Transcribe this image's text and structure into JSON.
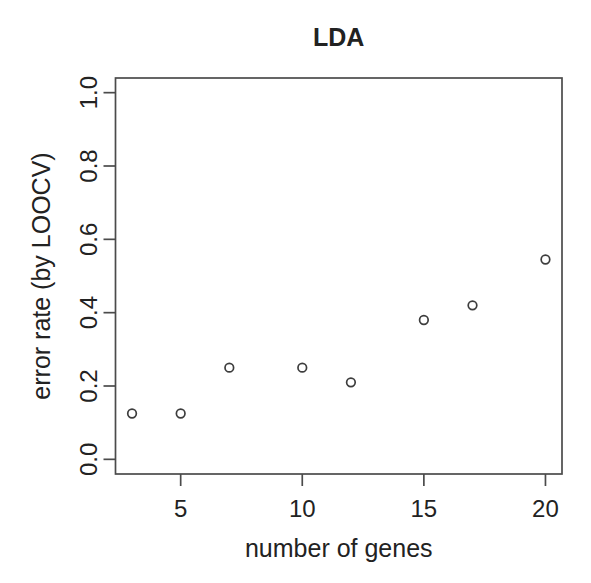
{
  "chart_data": {
    "type": "scatter",
    "title": "LDA",
    "xlabel": "number of genes",
    "ylabel": "error rate (by LOOCV)",
    "x": [
      3,
      5,
      7,
      10,
      12,
      15,
      17,
      20
    ],
    "y": [
      0.125,
      0.125,
      0.25,
      0.25,
      0.21,
      0.38,
      0.42,
      0.545
    ],
    "xlim": [
      3,
      20
    ],
    "ylim": [
      0,
      1
    ],
    "xticks": [
      5,
      10,
      15,
      20
    ],
    "xtick_labels": [
      "5",
      "10",
      "15",
      "20"
    ],
    "yticks": [
      0,
      0.2,
      0.4,
      0.6,
      0.8,
      1
    ],
    "ytick_labels": [
      "0.0",
      "0.2",
      "0.4",
      "0.6",
      "0.8",
      "1.0"
    ],
    "grid": false,
    "legend": null,
    "marker": "open-circle",
    "colors": {
      "points": "#3d3d3d",
      "axis": "#4b4b4b",
      "text": "#222222",
      "background": "#ffffff"
    }
  }
}
